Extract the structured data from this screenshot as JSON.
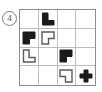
{
  "figure": {
    "label": "item-number-circle",
    "number": "4",
    "number_style": "circled",
    "type": "grid-puzzle",
    "grid": {
      "rows": 4,
      "columns": 4,
      "border_color": "#8c8c8c",
      "line_color": "#bdbdbd",
      "background_color": "#ffffff"
    },
    "colors": {
      "filled": "#1a1a1a",
      "outline": "#5a5a5a",
      "empty": "#ffffff"
    },
    "cells": [
      {
        "row": 1,
        "col": 1,
        "shape": "empty",
        "fill": "none"
      },
      {
        "row": 1,
        "col": 2,
        "shape": "l-tetromino",
        "fill": "black"
      },
      {
        "row": 1,
        "col": 3,
        "shape": "empty",
        "fill": "none"
      },
      {
        "row": 1,
        "col": 4,
        "shape": "empty",
        "fill": "none"
      },
      {
        "row": 2,
        "col": 1,
        "shape": "notched-square-br",
        "fill": "black"
      },
      {
        "row": 2,
        "col": 2,
        "shape": "notched-square-br",
        "fill": "outline"
      },
      {
        "row": 2,
        "col": 3,
        "shape": "empty",
        "fill": "none"
      },
      {
        "row": 2,
        "col": 4,
        "shape": "empty",
        "fill": "none"
      },
      {
        "row": 3,
        "col": 1,
        "shape": "l-tetromino",
        "fill": "outline"
      },
      {
        "row": 3,
        "col": 2,
        "shape": "empty",
        "fill": "none"
      },
      {
        "row": 3,
        "col": 3,
        "shape": "notched-square-br",
        "fill": "black"
      },
      {
        "row": 3,
        "col": 4,
        "shape": "empty",
        "fill": "none"
      },
      {
        "row": 4,
        "col": 1,
        "shape": "empty",
        "fill": "none"
      },
      {
        "row": 4,
        "col": 2,
        "shape": "empty",
        "fill": "none"
      },
      {
        "row": 4,
        "col": 3,
        "shape": "notched-square-bl",
        "fill": "outline"
      },
      {
        "row": 4,
        "col": 4,
        "shape": "plus",
        "fill": "black"
      }
    ]
  }
}
